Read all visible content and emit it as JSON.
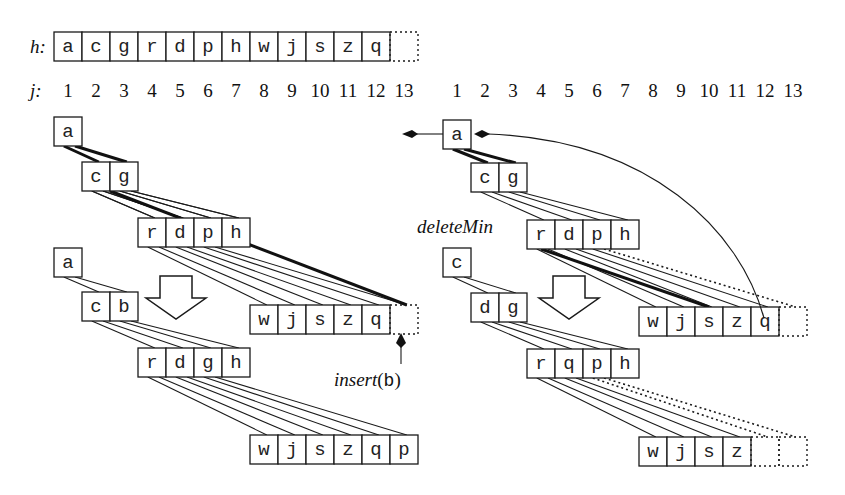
{
  "heap_array": {
    "label": "h:",
    "cells": [
      "a",
      "c",
      "g",
      "r",
      "d",
      "p",
      "h",
      "w",
      "j",
      "s",
      "z",
      "q"
    ],
    "empty_slot": true
  },
  "index_row": {
    "label": "j:",
    "left": [
      "1",
      "2",
      "3",
      "4",
      "5",
      "6",
      "7",
      "8",
      "9",
      "10",
      "11",
      "12",
      "13"
    ],
    "right": [
      "1",
      "2",
      "3",
      "4",
      "5",
      "6",
      "7",
      "8",
      "9",
      "10",
      "11",
      "12",
      "13"
    ]
  },
  "left_panel": {
    "before": {
      "levels": [
        [
          "a"
        ],
        [
          "c",
          "g"
        ],
        [
          "r",
          "d",
          "p",
          "h"
        ],
        [
          "w",
          "j",
          "s",
          "z",
          "q"
        ]
      ]
    },
    "after": {
      "levels": [
        [
          "a"
        ],
        [
          "c",
          "b"
        ],
        [
          "r",
          "d",
          "g",
          "h"
        ],
        [
          "w",
          "j",
          "s",
          "z",
          "q",
          "p"
        ]
      ]
    },
    "operation": {
      "name": "insert",
      "open": "(",
      "arg": "b",
      "close": ")"
    }
  },
  "right_panel": {
    "before": {
      "levels": [
        [
          "a"
        ],
        [
          "c",
          "g"
        ],
        [
          "r",
          "d",
          "p",
          "h"
        ],
        [
          "w",
          "j",
          "s",
          "z",
          "q"
        ]
      ]
    },
    "after": {
      "levels": [
        [
          "c"
        ],
        [
          "d",
          "g"
        ],
        [
          "r",
          "q",
          "p",
          "h"
        ],
        [
          "w",
          "j",
          "s",
          "z"
        ]
      ]
    },
    "operation": {
      "name": "deleteMin"
    }
  }
}
